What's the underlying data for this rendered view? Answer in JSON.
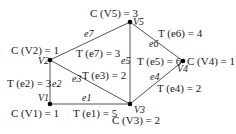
{
  "diagram": {
    "type": "weighted-graph",
    "nodes": [
      {
        "id": "V1",
        "label": "V1",
        "cost_label": "C (V1) = 1",
        "x": 50,
        "y": 104
      },
      {
        "id": "V2",
        "label": "V2",
        "cost_label": "C (V2) = 1",
        "x": 50,
        "y": 60
      },
      {
        "id": "V3",
        "label": "V3",
        "cost_label": "C (V3) = 2",
        "x": 130,
        "y": 104
      },
      {
        "id": "V4",
        "label": "V4",
        "cost_label": "C (V4) = 1",
        "x": 183,
        "y": 61
      },
      {
        "id": "V5",
        "label": "V5",
        "cost_label": "C (V5) = 3",
        "x": 130,
        "y": 22
      }
    ],
    "edges": [
      {
        "id": "e1",
        "label": "e1",
        "from": "V1",
        "to": "V3",
        "weight_label": "T (e1) = 5"
      },
      {
        "id": "e2",
        "label": "e2",
        "from": "V1",
        "to": "V2",
        "weight_label": "T (e2) = 3"
      },
      {
        "id": "e3",
        "label": "e3",
        "from": "V2",
        "to": "V3",
        "weight_label": "T (e3) = 2"
      },
      {
        "id": "e4",
        "label": "e4",
        "from": "V3",
        "to": "V4",
        "weight_label": "T (e4) = 2"
      },
      {
        "id": "e5",
        "label": "e5",
        "from": "V3",
        "to": "V5",
        "weight_label": "T (e5) = 6"
      },
      {
        "id": "e6",
        "label": "e6",
        "from": "V5",
        "to": "V4",
        "weight_label": "T (e6) = 4"
      },
      {
        "id": "e7",
        "label": "e7",
        "from": "V2",
        "to": "V5",
        "weight_label": "T (e7) = 3"
      }
    ]
  }
}
